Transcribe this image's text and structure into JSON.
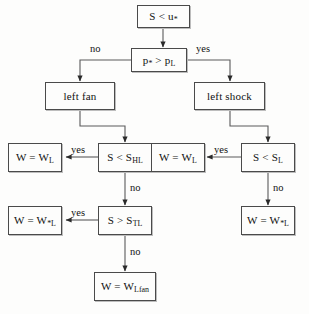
{
  "diagram": {
    "stroke_color": "#4a4a4a",
    "text_color": "#111111",
    "background_color": "#fdfdfc",
    "nodes": {
      "root": "S < u*",
      "pressure_test": "p* > p_L",
      "left_fan": "left fan",
      "left_shock": "left shock",
      "fan_head_test": "S < S_HL",
      "fan_tail_test": "S > S_TL",
      "shock_test": "S < S_L",
      "fan_head_result": "W = W_L",
      "fan_tail_result": "W = W_*L",
      "fan_inside_result": "W = W_Lfan",
      "shock_left_result": "W = W_L",
      "shock_star_result": "W = W_*L"
    },
    "edge_labels": {
      "pressure_no": "no",
      "pressure_yes": "yes",
      "fan_head_yes": "yes",
      "fan_head_no": "no",
      "fan_tail_yes": "yes",
      "fan_tail_no": "no",
      "shock_yes": "yes",
      "shock_no": "no"
    }
  }
}
